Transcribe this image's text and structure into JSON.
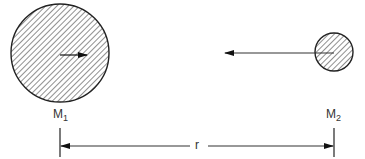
{
  "diagram": {
    "mass1": {
      "label": "M",
      "subscript": "1"
    },
    "mass2": {
      "label": "M",
      "subscript": "2"
    },
    "distance": {
      "label": "r"
    },
    "colors": {
      "stroke": "#222222",
      "hatch": "#333333",
      "background": "#ffffff"
    }
  }
}
